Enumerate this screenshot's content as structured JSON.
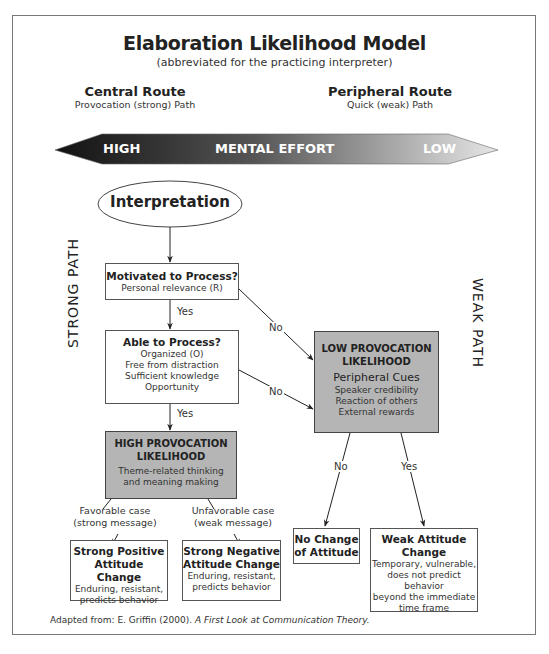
{
  "title": "Elaboration Likelihood Model",
  "subtitle": "(abbreviated for the practicing interpreter)",
  "routes": {
    "central": {
      "heading": "Central Route",
      "sub": "Provocation (strong) Path"
    },
    "peripheral": {
      "heading": "Peripheral Route",
      "sub": "Quick (weak) Path"
    }
  },
  "effort_arrow": {
    "left": "HIGH",
    "center": "MENTAL EFFORT",
    "right": "LOW"
  },
  "side_labels": {
    "strong": "STRONG PATH",
    "weak": "WEAK PATH"
  },
  "nodes": {
    "start": "Interpretation",
    "motivated": {
      "heading": "Motivated to Process?",
      "lines": [
        "Personal relevance (R)"
      ]
    },
    "able": {
      "heading": "Able to Process?",
      "lines": [
        "Organized (O)",
        "Free from distraction",
        "Sufficient knowledge",
        "Opportunity"
      ]
    },
    "high": {
      "heading1": "HIGH PROVOCATION",
      "heading2": "LIKELIHOOD",
      "lines": [
        "Theme-related thinking",
        "and meaning making"
      ]
    },
    "low": {
      "heading1": "LOW PROVOCATION",
      "heading2": "LIKELIHOOD",
      "sub_heading": "Peripheral Cues",
      "lines": [
        "Speaker credibility",
        "Reaction of others",
        "External rewards"
      ]
    },
    "strong_positive": {
      "heading1": "Strong Positive",
      "heading2": "Attitude Change",
      "lines": [
        "Enduring, resistant,",
        "predicts behavior"
      ]
    },
    "strong_negative": {
      "heading1": "Strong Negative",
      "heading2": "Attitude Change",
      "lines": [
        "Enduring, resistant,",
        "predicts behavior"
      ]
    },
    "no_change": {
      "heading1": "No Change",
      "heading2": "of Attitude"
    },
    "weak_change": {
      "heading1": "Weak Attitude",
      "heading2": "Change",
      "lines": [
        "Temporary, vulnerable,",
        "does not predict behavior",
        "beyond the immediate",
        "time frame"
      ]
    }
  },
  "edge_labels": {
    "yes1": "Yes",
    "yes2": "Yes",
    "no1": "No",
    "no2": "No",
    "favorable": "Favorable case",
    "favorable_sub": "(strong message)",
    "unfavorable": "Unfavorable case",
    "unfavorable_sub": "(weak message)",
    "low_no": "No",
    "low_yes": "Yes"
  },
  "citation": {
    "prefix": "Adapted from: E. Griffin (2000). ",
    "title": "A First Look at Communication Theory."
  }
}
